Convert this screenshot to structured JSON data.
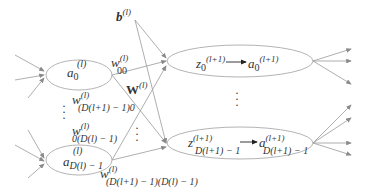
{
  "diagram": {
    "type": "neural-network-layer",
    "left_nodes": [
      {
        "id": "a0",
        "base": "a",
        "sub": "0",
        "sup": "(l)"
      },
      {
        "id": "aD",
        "base": "a",
        "sub": "D(l) − 1",
        "sup": "(l)"
      }
    ],
    "right_nodes": [
      {
        "id": "z0a0",
        "z": "z",
        "z_sub": "0",
        "z_sup": "(l+1)",
        "a": "a",
        "a_sub": "0",
        "a_sup": "(l+1)"
      },
      {
        "id": "zDaD",
        "z": "z",
        "z_sub": "D(l+1) − 1",
        "z_sup": "(l+1)",
        "a": "a",
        "a_sub": "D(l+1) − 1",
        "a_sup": "(l+1)"
      }
    ],
    "labels": {
      "bias": {
        "base": "b",
        "sup": "(l)"
      },
      "weights": {
        "base": "W",
        "sup": "(l)"
      },
      "w00": {
        "base": "w",
        "sup": "(l)",
        "sub": "00"
      },
      "wD0": {
        "base": "w",
        "sup": "(l)",
        "sub": "(D(l+1) − 1)0"
      },
      "w0D": {
        "base": "w",
        "sup": "(l)",
        "sub": "0(D(l) − 1)"
      },
      "wDD": {
        "base": "w",
        "sup": "(l)",
        "sub": "(D(l+1) − 1)(D(l) − 1)"
      }
    },
    "ellipsis": "⋮",
    "colors": {
      "edge": "#999999",
      "node": "#aaaaaa",
      "text": "#333333"
    }
  }
}
